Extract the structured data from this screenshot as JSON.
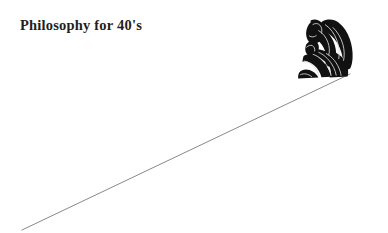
{
  "canvas": {
    "width": 388,
    "height": 233,
    "background_color": "#ffffff"
  },
  "title": {
    "text": "Philosophy for 40's",
    "color": "#231f20"
  },
  "artwork": {
    "name": "thinker-on-slope-illustration",
    "slope_line": {
      "name": "diagonal-slope-line",
      "color": "#7b7b81",
      "stroke_width": 0.9,
      "x1": 22,
      "y1": 230,
      "x2": 350,
      "y2": 74
    },
    "figure": {
      "name": "thinker-silhouette",
      "color": "#111111",
      "highlight_color": "#d9d9dd",
      "bounds": {
        "x": 299,
        "y": 16,
        "width": 58,
        "height": 64
      }
    }
  }
}
